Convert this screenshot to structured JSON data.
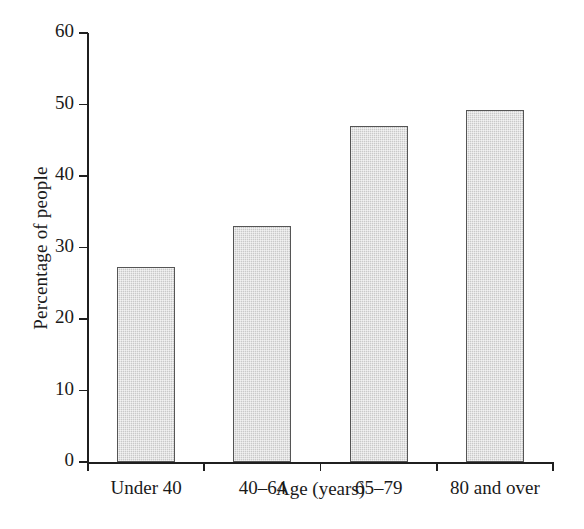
{
  "chart_data": {
    "type": "bar",
    "title": "",
    "categories": [
      "Under 40",
      "40–64",
      "65–79",
      "80 and over"
    ],
    "values": [
      27.3,
      33.0,
      47.0,
      49.3
    ],
    "xlabel": "Age (years)",
    "ylabel": "Percentage of people",
    "ylim": [
      0,
      60
    ],
    "yticks": [
      0,
      10,
      20,
      30,
      40,
      50,
      60
    ],
    "ytick_labels": [
      "0",
      "10",
      "20",
      "30",
      "40",
      "50",
      "60"
    ],
    "grid": false,
    "legend": null,
    "bar_fill_color": "#c9c9c9",
    "bar_edge_color": "#555555",
    "axis_color": "#1f1f1f"
  }
}
